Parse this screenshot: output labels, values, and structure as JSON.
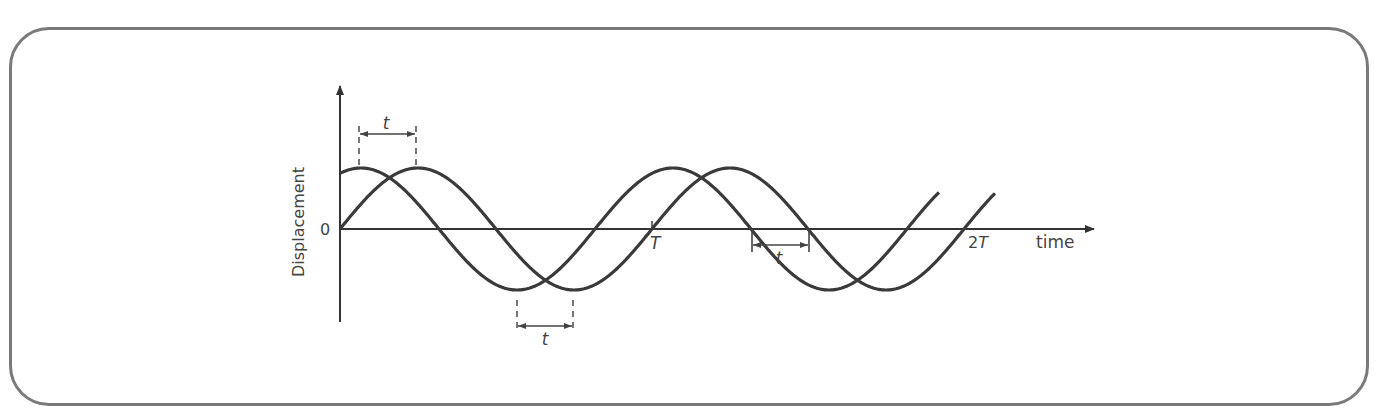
{
  "figure": {
    "y_axis_label": "Displacement",
    "x_axis_label": "time",
    "origin_label": "0",
    "tick_labels": {
      "T": "T",
      "two_T_prefix": "2",
      "two_T_suffix": "T"
    },
    "phase_offset_label": "t",
    "colors": {
      "curve": "#3a3a3a",
      "axis": "#333333",
      "frame": "#7a7a7a",
      "annotation": "#555555"
    }
  },
  "chart_data": {
    "type": "line",
    "title": "",
    "xlabel": "time",
    "ylabel": "Displacement",
    "x_ticks": [
      "0",
      "T",
      "2T"
    ],
    "series": [
      {
        "name": "wave leading by t",
        "shape": "sinusoid",
        "amplitude": 1,
        "period": "T",
        "phase_lead": "t",
        "x_range": [
          "0",
          "~1.9T"
        ]
      },
      {
        "name": "wave starting at 0",
        "shape": "sine",
        "amplitude": 1,
        "period": "T",
        "phase_lead": "0",
        "x_range": [
          "0",
          "~2.1T"
        ]
      }
    ],
    "annotations": [
      {
        "label": "t",
        "between": "peaks of the two waves near start"
      },
      {
        "label": "t",
        "between": "troughs of the two waves in first cycle"
      },
      {
        "label": "t",
        "between": "downward zero-crossings in second cycle"
      }
    ],
    "grid": false
  }
}
